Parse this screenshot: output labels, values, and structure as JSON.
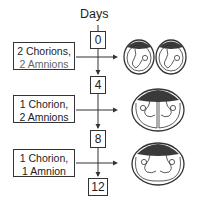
{
  "title": "Days",
  "days": [
    "0",
    "4",
    "8",
    "12"
  ],
  "stages": [
    {
      "line1": "2 Chorions,",
      "line2": "2 Amnions",
      "illustration": "two-separate-sacs-icon"
    },
    {
      "line1": "1 Chorion,",
      "line2": "2 Amnions",
      "illustration": "shared-chorion-divided-amnion-icon"
    },
    {
      "line1": "1 Chorion,",
      "line2": "1 Amnion",
      "illustration": "shared-chorion-shared-amnion-icon"
    }
  ],
  "colors": {
    "line": "#333333",
    "placenta": "#3a3a3a"
  }
}
